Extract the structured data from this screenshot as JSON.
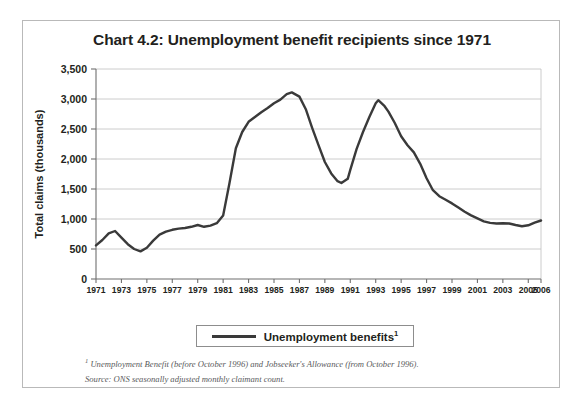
{
  "chart_data": {
    "type": "line",
    "title": "Chart 4.2: Unemployment benefit recipients since 1971",
    "xlabel": "",
    "ylabel": "Total claims (thousands)",
    "xlim": [
      1971,
      2006
    ],
    "ylim": [
      0,
      3500
    ],
    "grid": "horizontal",
    "legend_position": "bottom-center",
    "y_ticks": [
      "0",
      "500",
      "1,000",
      "1,500",
      "2,000",
      "2,500",
      "3,000",
      "3,500"
    ],
    "y_tick_values": [
      0,
      500,
      1000,
      1500,
      2000,
      2500,
      3000,
      3500
    ],
    "x_ticks": [
      "1971",
      "1973",
      "1975",
      "1977",
      "1979",
      "1981",
      "1983",
      "1985",
      "1987",
      "1989",
      "1991",
      "1993",
      "1995",
      "1997",
      "1999",
      "2001",
      "2003",
      "2005",
      "2006"
    ],
    "x_tick_values": [
      1971,
      1973,
      1975,
      1977,
      1979,
      1981,
      1983,
      1985,
      1987,
      1989,
      1991,
      1993,
      1995,
      1997,
      1999,
      2001,
      2003,
      2005,
      2006
    ],
    "series": [
      {
        "name": "Unemployment benefits",
        "color": "#3a3a3a",
        "x": [
          1971.0,
          1971.5,
          1972.0,
          1972.5,
          1973.0,
          1973.5,
          1974.0,
          1974.5,
          1975.0,
          1975.5,
          1976.0,
          1976.5,
          1977.0,
          1977.5,
          1978.0,
          1978.5,
          1979.0,
          1979.5,
          1980.0,
          1980.5,
          1981.0,
          1981.5,
          1982.0,
          1982.5,
          1983.0,
          1983.5,
          1984.0,
          1984.5,
          1985.0,
          1985.5,
          1986.0,
          1986.4,
          1987.0,
          1987.5,
          1988.0,
          1988.5,
          1989.0,
          1989.5,
          1990.0,
          1990.3,
          1990.8,
          1991.0,
          1991.5,
          1992.0,
          1992.5,
          1993.0,
          1993.2,
          1993.7,
          1994.0,
          1994.5,
          1995.0,
          1995.5,
          1996.0,
          1996.5,
          1997.0,
          1997.5,
          1998.0,
          1998.5,
          1999.0,
          1999.5,
          2000.0,
          2000.5,
          2001.0,
          2001.5,
          2002.0,
          2002.5,
          2003.0,
          2003.5,
          2004.0,
          2004.5,
          2005.0,
          2005.5,
          2006.0
        ],
        "y": [
          560,
          650,
          760,
          800,
          690,
          580,
          500,
          460,
          520,
          640,
          740,
          790,
          820,
          840,
          850,
          870,
          900,
          870,
          890,
          930,
          1060,
          1600,
          2180,
          2450,
          2620,
          2700,
          2780,
          2850,
          2930,
          2990,
          3080,
          3110,
          3040,
          2830,
          2520,
          2230,
          1950,
          1760,
          1630,
          1600,
          1670,
          1820,
          2170,
          2450,
          2700,
          2930,
          2980,
          2880,
          2790,
          2600,
          2380,
          2230,
          2110,
          1920,
          1680,
          1480,
          1380,
          1320,
          1260,
          1190,
          1120,
          1060,
          1010,
          960,
          935,
          925,
          930,
          925,
          900,
          880,
          895,
          940,
          975
        ]
      }
    ],
    "legend": [
      {
        "label": "Unemployment benefits",
        "superscript": "1",
        "color": "#3a3a3a"
      }
    ],
    "footnotes": [
      {
        "marker": "1",
        "text": "Unemployment Benefit (before October 1996) and Jobseeker's Allowance (from October 1996)."
      }
    ],
    "source": "Source: ONS seasonally adjusted monthly claimant count."
  },
  "figure": {
    "title": "Chart 4.2: Unemployment benefit recipients since 1971",
    "ylabel": "Total claims (thousands)",
    "legend_label": "Unemployment benefits",
    "legend_superscript": "1",
    "footnote_marker": "1",
    "footnote_text": "Unemployment Benefit (before October 1996) and Jobseeker's Allowance (from October 1996).",
    "source_text": "Source: ONS seasonally adjusted monthly claimant count.",
    "colors": {
      "line": "#3a3a3a",
      "grid": "#bfbfbf",
      "axis": "#6f6f6f",
      "text": "#231f20",
      "border": "#b9b9b9",
      "note": "#58595b"
    }
  }
}
